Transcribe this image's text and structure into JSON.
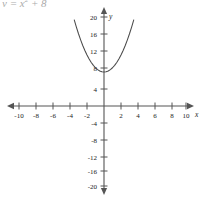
{
  "caption": {
    "text": "y = x",
    "exponent": "2",
    "text_tail": " + 8"
  },
  "chart_data": {
    "type": "line",
    "title": "",
    "subtitle": "",
    "xlabel": "x",
    "ylabel": "y",
    "equation": "y = x^2 + 8",
    "grid": false,
    "legend": null,
    "xlim": [
      -11,
      11
    ],
    "ylim": [
      -22,
      22
    ],
    "x_ticks": [
      -10,
      -8,
      -6,
      -4,
      -2,
      2,
      4,
      6,
      8,
      10
    ],
    "y_ticks": [
      20,
      16,
      12,
      8,
      4,
      -4,
      -8,
      -12,
      -16,
      -20
    ],
    "x_tick_labels": [
      "-10",
      "-8",
      "-6",
      "-4",
      "-2",
      "2",
      "4",
      "6",
      "8",
      "10"
    ],
    "y_tick_labels": [
      "20",
      "16",
      "12",
      "8",
      "4",
      "-4",
      "-8",
      "-12",
      "-16",
      "-20"
    ],
    "vertex": [
      0,
      8
    ],
    "curve_color": "#4a4a4a",
    "axis_color": "#555555",
    "series": [
      {
        "name": "y = x^2 + 8",
        "x": [
          -3.5,
          -3.25,
          -3,
          -2.75,
          -2.5,
          -2.25,
          -2,
          -1.75,
          -1.5,
          -1.25,
          -1,
          -0.75,
          -0.5,
          -0.25,
          0,
          0.25,
          0.5,
          0.75,
          1,
          1.25,
          1.5,
          1.75,
          2,
          2.25,
          2.5,
          2.75,
          3,
          3.25,
          3.5
        ],
        "values": [
          20.25,
          18.56,
          17,
          15.56,
          14.25,
          13.06,
          12,
          11.06,
          10.25,
          9.56,
          9,
          8.56,
          8.25,
          8.06,
          8,
          8.06,
          8.25,
          8.56,
          9,
          9.56,
          10.25,
          11.06,
          12,
          13.06,
          14.25,
          15.56,
          17,
          18.56,
          20.25
        ]
      }
    ]
  },
  "axes": {
    "x_axis_name": "x",
    "y_axis_name": "y"
  }
}
